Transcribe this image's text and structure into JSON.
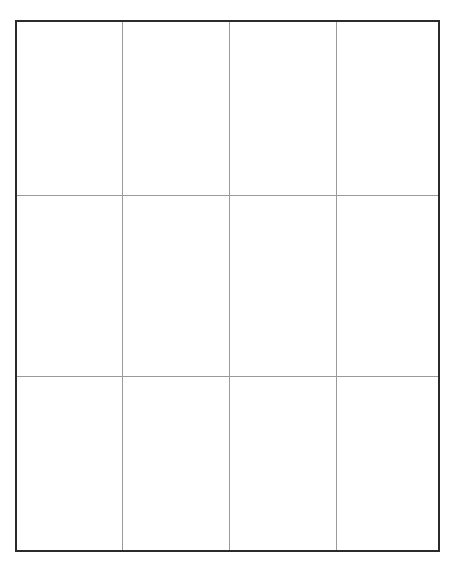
{
  "document": {
    "type": "blank-grid-table",
    "background_color": "#ffffff",
    "page_width": 458,
    "page_height": 570
  },
  "table": {
    "rows": 3,
    "columns": 4,
    "outer_border_color": "#2b2b2b",
    "outer_border_width_px": 2,
    "inner_line_color": "#9a9a9a",
    "inner_line_width_px": 1,
    "cell_background": "#ffffff",
    "column_widths_px": [
      106,
      107,
      107,
      101
    ],
    "row_heights_px": [
      174,
      181,
      173
    ],
    "cells": [
      [
        "",
        "",
        "",
        ""
      ],
      [
        "",
        "",
        "",
        ""
      ],
      [
        "",
        "",
        "",
        ""
      ]
    ]
  }
}
